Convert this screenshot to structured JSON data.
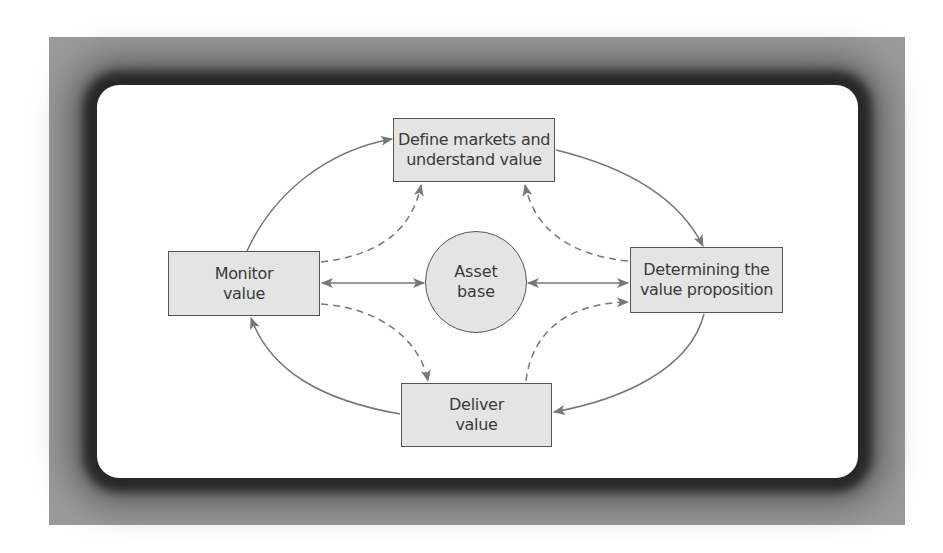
{
  "diagram": {
    "nodes": {
      "define": {
        "label": "Define markets and\nunderstand value"
      },
      "monitor": {
        "label": "Monitor\nvalue"
      },
      "asset": {
        "label": "Asset\nbase"
      },
      "determining": {
        "label": "Determining the\nvalue proposition"
      },
      "deliver": {
        "label": "Deliver\nvalue"
      }
    },
    "edges": [
      {
        "from": "monitor",
        "to": "define",
        "style": "solid"
      },
      {
        "from": "define",
        "to": "determining",
        "style": "solid"
      },
      {
        "from": "determining",
        "to": "deliver",
        "style": "solid"
      },
      {
        "from": "deliver",
        "to": "monitor",
        "style": "solid"
      },
      {
        "from": "monitor",
        "to": "define",
        "style": "dashed"
      },
      {
        "from": "determining",
        "to": "define",
        "style": "dashed"
      },
      {
        "from": "monitor",
        "to": "deliver",
        "style": "dashed"
      },
      {
        "from": "deliver",
        "to": "determining",
        "style": "dashed"
      },
      {
        "from": "monitor",
        "to": "asset",
        "style": "solid-bidirectional"
      },
      {
        "from": "determining",
        "to": "asset",
        "style": "solid-bidirectional"
      }
    ],
    "colors": {
      "frame": "#9a9a9a",
      "node_fill": "#e4e4e4",
      "node_border": "#555555",
      "line": "#777777",
      "text": "#3a3a3a"
    }
  }
}
